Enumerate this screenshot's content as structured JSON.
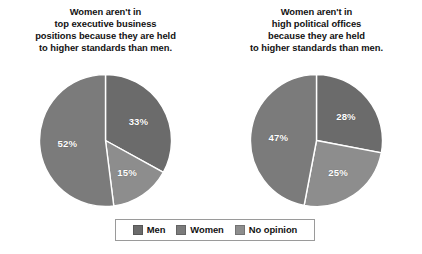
{
  "figure": {
    "background": "#ffffff"
  },
  "legend": {
    "position": "bottom-center",
    "entries": [
      {
        "label": "Men",
        "color": "#6b6b6b",
        "icon": "legend-swatch-icon"
      },
      {
        "label": "Women",
        "color": "#7b7b7b",
        "icon": "legend-swatch-icon"
      },
      {
        "label": "No opinion",
        "color": "#8d8d8d",
        "icon": "legend-swatch-icon"
      }
    ]
  },
  "chart_data": [
    {
      "type": "pie",
      "title": "Women aren't in\ntop executive business\npositions because they are held\nto higher standards than men.",
      "categories": [
        "Men",
        "Women",
        "No opinion"
      ],
      "values": [
        33,
        52,
        15
      ],
      "labels": [
        "33%",
        "52%",
        "15%"
      ],
      "colors": [
        "#6b6b6b",
        "#7b7b7b",
        "#8d8d8d"
      ],
      "start_angle": 0,
      "direction": "clockwise",
      "draw_order": [
        "Men",
        "No opinion",
        "Women"
      ],
      "legend": "bottom",
      "grid": false,
      "xlabel": "",
      "ylabel": ""
    },
    {
      "type": "pie",
      "title": "Women aren't in\nhigh political offices\nbecause they are held\nto higher standards than men.",
      "categories": [
        "Men",
        "Women",
        "No opinion"
      ],
      "values": [
        28,
        47,
        25
      ],
      "labels": [
        "28%",
        "47%",
        "25%"
      ],
      "colors": [
        "#6b6b6b",
        "#7b7b7b",
        "#8d8d8d"
      ],
      "start_angle": 0,
      "direction": "clockwise",
      "draw_order": [
        "Men",
        "No opinion",
        "Women"
      ],
      "legend": "bottom",
      "grid": false,
      "xlabel": "",
      "ylabel": ""
    }
  ]
}
